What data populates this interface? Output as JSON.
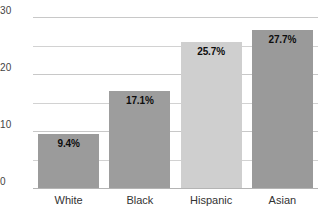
{
  "chart_data": {
    "type": "bar",
    "title": "",
    "subtitle": "",
    "xlabel": "",
    "ylabel": "",
    "categories": [
      "White",
      "Black",
      "Hispanic",
      "Asian"
    ],
    "values": [
      9.4,
      17.1,
      25.7,
      27.7
    ],
    "value_labels": [
      "9.4%",
      "17.1%",
      "25.7%",
      "27.7%"
    ],
    "bar_colors": [
      "#9b9b9b",
      "#9d9d9d",
      "#cfcfcf",
      "#9a9a9a"
    ],
    "ylim": [
      0,
      30
    ],
    "yticks": [
      0,
      10,
      20,
      30
    ],
    "ytick_labels": [
      "0",
      "10",
      "20",
      "30"
    ],
    "gridlines": [
      0,
      5,
      10,
      15,
      20,
      25,
      30
    ],
    "grid": true,
    "legend": "none",
    "grid_color": "#d2d2d2",
    "axis_color": "#b4b4b4",
    "label_color": "#333333",
    "value_label_color": "#0d0d0d"
  }
}
